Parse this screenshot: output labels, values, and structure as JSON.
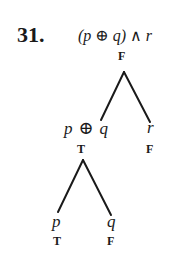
{
  "problem": {
    "number": "31.",
    "expression": "(p ⊕ q) ∧ r"
  },
  "tree": {
    "root": {
      "value": "F",
      "left": {
        "label_p": "p",
        "label_op": "⊕",
        "label_q": "q",
        "value": "T",
        "left": {
          "label": "p",
          "value": "T"
        },
        "right": {
          "label": "q",
          "value": "F"
        }
      },
      "right": {
        "label": "r",
        "value": "F"
      }
    }
  }
}
